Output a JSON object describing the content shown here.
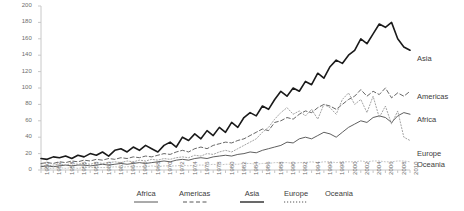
{
  "chart_data": {
    "type": "line",
    "title": "",
    "xlabel": "",
    "ylabel": "",
    "ylim": [
      0,
      200
    ],
    "ytick_step": 20,
    "grid": false,
    "legend_position": "bottom",
    "yticks": [
      "200",
      "180",
      "160",
      "140",
      "120",
      "100",
      "80",
      "60",
      "40",
      "20",
      "0"
    ],
    "categories": [
      "1950",
      "1951",
      "1952",
      "1953",
      "1954",
      "1955",
      "1956",
      "1957",
      "1958",
      "1959",
      "1960",
      "1961",
      "1962",
      "1963",
      "1964",
      "1965",
      "1966",
      "1967",
      "1968",
      "1969",
      "1970",
      "1971",
      "1972",
      "1973",
      "1974",
      "1975",
      "1976",
      "1977",
      "1978",
      "1979",
      "1980",
      "1981",
      "1982",
      "1983",
      "1984",
      "1985",
      "1986",
      "1987",
      "1988",
      "1989",
      "1990",
      "1991",
      "1992",
      "1993",
      "1994",
      "1995",
      "1996",
      "1997",
      "1998",
      "1999",
      "2000",
      "2001",
      "2002",
      "2003",
      "2004",
      "2005",
      "2006",
      "2007",
      "2008",
      "2009",
      "2010"
    ],
    "xtick_labels": [
      "1950",
      "1952",
      "1954",
      "1956",
      "1958",
      "1960",
      "1962",
      "1964",
      "1966",
      "1968",
      "1970",
      "1972",
      "1974",
      "1976",
      "1978",
      "1980",
      "1982",
      "1984",
      "1986",
      "1988",
      "1990",
      "1992",
      "1994",
      "1996",
      "1998",
      "2000",
      "2002",
      "2004",
      "2006",
      "2008",
      "2010"
    ],
    "series": [
      {
        "name": "Africa",
        "style": "solid-thin",
        "color": "#4d4d4d",
        "values": [
          4,
          5,
          4,
          5,
          6,
          5,
          6,
          6,
          5,
          6,
          7,
          6,
          7,
          8,
          7,
          8,
          9,
          8,
          9,
          10,
          11,
          10,
          12,
          13,
          12,
          14,
          15,
          14,
          16,
          17,
          18,
          17,
          19,
          20,
          22,
          21,
          24,
          26,
          28,
          30,
          34,
          33,
          38,
          40,
          38,
          42,
          46,
          44,
          40,
          46,
          52,
          56,
          60,
          58,
          64,
          66,
          64,
          58,
          66,
          70,
          68
        ]
      },
      {
        "name": "Americas",
        "style": "dashed",
        "color": "#555555",
        "values": [
          8,
          9,
          8,
          10,
          9,
          11,
          10,
          12,
          11,
          13,
          12,
          14,
          13,
          15,
          14,
          16,
          15,
          17,
          16,
          18,
          20,
          19,
          22,
          24,
          22,
          26,
          28,
          26,
          30,
          32,
          34,
          33,
          36,
          38,
          42,
          46,
          50,
          48,
          58,
          60,
          64,
          62,
          68,
          72,
          70,
          76,
          80,
          78,
          74,
          80,
          86,
          90,
          98,
          90,
          96,
          92,
          100,
          88,
          94,
          90,
          96
        ]
      },
      {
        "name": "Asia",
        "style": "solid-thick",
        "color": "#1a1a1a",
        "values": [
          14,
          13,
          16,
          15,
          17,
          14,
          18,
          16,
          20,
          18,
          22,
          17,
          24,
          26,
          22,
          28,
          24,
          30,
          26,
          22,
          30,
          34,
          28,
          40,
          36,
          44,
          38,
          48,
          42,
          52,
          46,
          58,
          52,
          64,
          70,
          66,
          78,
          74,
          86,
          96,
          90,
          100,
          96,
          108,
          104,
          118,
          112,
          126,
          134,
          130,
          140,
          146,
          160,
          154,
          166,
          178,
          174,
          180,
          160,
          150,
          146
        ]
      },
      {
        "name": "Europe",
        "style": "dotted",
        "color": "#9a9a9a",
        "values": [
          6,
          5,
          6,
          7,
          6,
          8,
          7,
          8,
          7,
          9,
          8,
          9,
          10,
          9,
          11,
          10,
          12,
          11,
          13,
          12,
          14,
          13,
          15,
          16,
          15,
          18,
          17,
          20,
          19,
          22,
          24,
          22,
          26,
          30,
          34,
          38,
          46,
          52,
          62,
          70,
          76,
          68,
          72,
          66,
          74,
          62,
          80,
          76,
          68,
          86,
          94,
          80,
          86,
          70,
          90,
          64,
          78,
          56,
          72,
          40,
          36
        ]
      },
      {
        "name": "Oceania",
        "style": "dotted-light",
        "color": "#b5b5b5",
        "values": [
          2,
          2,
          2,
          3,
          2,
          3,
          2,
          3,
          3,
          3,
          3,
          3,
          4,
          3,
          4,
          4,
          4,
          4,
          5,
          4,
          5,
          5,
          5,
          6,
          5,
          6,
          6,
          6,
          7,
          6,
          7,
          7,
          7,
          8,
          8,
          7,
          8,
          8,
          9,
          9,
          9,
          8,
          9,
          9,
          10,
          9,
          10,
          10,
          9,
          10,
          10,
          10,
          11,
          10,
          11,
          11,
          10,
          10,
          11,
          11,
          10
        ]
      }
    ],
    "series_end_labels": [
      {
        "name": "Asia",
        "label": "Asia"
      },
      {
        "name": "Americas",
        "label": "Americas"
      },
      {
        "name": "Africa",
        "label": "Africa"
      },
      {
        "name": "Europe",
        "label": "Europe"
      },
      {
        "name": "Oceania",
        "label": "Oceania"
      }
    ],
    "legend": [
      {
        "label": "Africa",
        "style": "solid-thin"
      },
      {
        "label": "Americas",
        "style": "dashed"
      },
      {
        "label": "Asia",
        "style": "solid-thick"
      },
      {
        "label": "Europe",
        "style": "dotted"
      },
      {
        "label": "Oceania",
        "style": "none"
      }
    ]
  }
}
